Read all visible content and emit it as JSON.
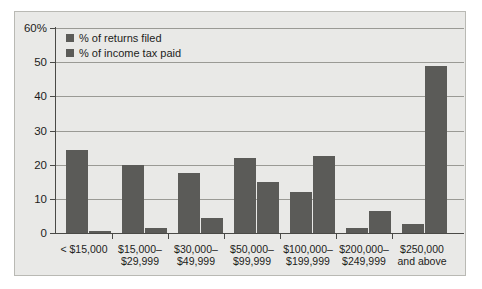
{
  "chart_data": {
    "type": "bar",
    "title": "",
    "xlabel": "",
    "ylabel": "",
    "ylim": [
      0,
      60
    ],
    "yticks": [
      "0",
      "10",
      "20",
      "30",
      "40",
      "50",
      "60%"
    ],
    "ytick_values": [
      0,
      10,
      20,
      30,
      40,
      50,
      60
    ],
    "grid": true,
    "legend_position": "top-left",
    "categories": [
      "< $15,000",
      "$15,000–\n$29,999",
      "$30,000–\n$49,999",
      "$50,000–\n$99,999",
      "$100,000–\n$199,999",
      "$200,000–\n$249,999",
      "$250,000\nand above"
    ],
    "category_lines": [
      [
        "< $15,000",
        ""
      ],
      [
        "$15,000–",
        "$29,999"
      ],
      [
        "$30,000–",
        "$49,999"
      ],
      [
        "$50,000–",
        "$99,999"
      ],
      [
        "$100,000–",
        "$199,999"
      ],
      [
        "$200,000–",
        "$249,999"
      ],
      [
        "$250,000",
        "and above"
      ]
    ],
    "series": [
      {
        "name": "% of returns filed",
        "color": "#5b5b58",
        "values": [
          24.3,
          20.0,
          17.5,
          22.0,
          12.0,
          1.5,
          2.5
        ]
      },
      {
        "name": "% of income tax paid",
        "color": "#5b5b58",
        "values": [
          0.5,
          1.5,
          4.4,
          15.0,
          22.5,
          6.5,
          49.0
        ]
      }
    ]
  },
  "legend": {
    "items": [
      {
        "label": "% of returns filed"
      },
      {
        "label": "% of income tax paid"
      }
    ]
  },
  "colors": {
    "panel_background": "#e9e9e7",
    "panel_border": "#b9b9b4",
    "bar": "#5b5b58",
    "gridline": "#9a9a95",
    "axis": "#4a4a47",
    "text": "#1d1d1b",
    "page_background": "#ffffff"
  }
}
